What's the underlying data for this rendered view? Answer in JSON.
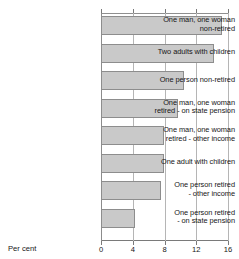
{
  "chart_data": {
    "type": "bar",
    "orientation": "horizontal",
    "title": "",
    "xlabel": "Per cent",
    "ylabel": "",
    "xlim": [
      0,
      16
    ],
    "xticks": [
      0,
      4,
      8,
      12,
      16
    ],
    "grid": true,
    "legend": false,
    "categories": [
      "One man, one woman non-retired",
      "Two adults with children",
      "One person non-retired",
      "One man, one woman retired - on state pension",
      "One man, one woman retired - other income",
      "One adult with children",
      "One person retired - other income",
      "One person retired - on state pension"
    ],
    "category_lines": [
      [
        "One man, one woman",
        "non-retired"
      ],
      [
        "Two adults with children"
      ],
      [
        "One person non-retired"
      ],
      [
        "One man, one woman",
        "retired - on state pension"
      ],
      [
        "One man, one woman",
        "retired - other income"
      ],
      [
        "One adult with children"
      ],
      [
        "One person retired",
        "- other income"
      ],
      [
        "One person retired",
        "- on state pension"
      ]
    ],
    "values": [
      15.2,
      14.2,
      10.5,
      9.7,
      7.9,
      7.9,
      7.5,
      4.3
    ]
  },
  "colors": {
    "bar_fill": "#c9c9c9",
    "bar_border": "#8d8d8d",
    "gridline": "#b5b5b5",
    "axis": "#7a7a7a",
    "text": "#161616",
    "background": "#ffffff"
  }
}
